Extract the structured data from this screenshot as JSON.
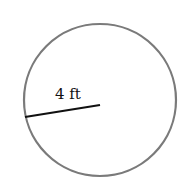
{
  "diagram": {
    "shape": "circle",
    "radius_label": "4 ft",
    "circle_stroke": "#7a7a7a",
    "radius_line_color": "#111111",
    "background": "#ffffff"
  }
}
